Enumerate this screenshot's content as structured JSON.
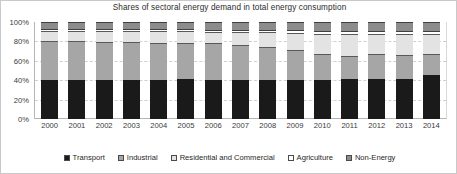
{
  "chart_data": {
    "type": "bar",
    "stacked": true,
    "stack_mode": "percent",
    "title": "Shares of sectoral energy demand in total energy consumption",
    "xlabel": "",
    "ylabel": "",
    "ylim": [
      0,
      100
    ],
    "ytick_labels": [
      "100%",
      "80%",
      "60%",
      "40%",
      "20%",
      "0%"
    ],
    "ytick_values": [
      100,
      80,
      60,
      40,
      20,
      0
    ],
    "grid": true,
    "legend_position": "bottom",
    "categories": [
      "2000",
      "2001",
      "2002",
      "2003",
      "2004",
      "2005",
      "2006",
      "2007",
      "2008",
      "2009",
      "2010",
      "2011",
      "2012",
      "2013",
      "2014"
    ],
    "series": [
      {
        "name": "Transport",
        "color": "#1a1a1a",
        "values": [
          40,
          40,
          40,
          40,
          40,
          41,
          40,
          40,
          40,
          40,
          40,
          41,
          41,
          41,
          45
        ]
      },
      {
        "name": "Industrial",
        "color": "#a6a6a6",
        "values": [
          40,
          40,
          39,
          39,
          38,
          37,
          38,
          36,
          34,
          31,
          27,
          24,
          26,
          25,
          22
        ]
      },
      {
        "name": "Residential and Commercial",
        "color": "#e3e3e3",
        "values": [
          11,
          11,
          12,
          12,
          13,
          13,
          12,
          14,
          16,
          18,
          21,
          23,
          21,
          22,
          21
        ]
      },
      {
        "name": "Agriculture",
        "color": "#ffffff",
        "values": [
          2,
          2,
          2,
          2,
          2,
          2,
          2,
          2,
          2,
          3,
          3,
          3,
          3,
          3,
          3
        ]
      },
      {
        "name": "Non-Energy",
        "color": "#8c8c8c",
        "values": [
          7,
          7,
          7,
          7,
          7,
          7,
          8,
          8,
          8,
          8,
          9,
          9,
          9,
          9,
          9
        ]
      }
    ]
  }
}
